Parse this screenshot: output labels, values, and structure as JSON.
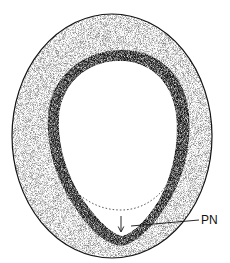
{
  "diagram": {
    "labels": {
      "pn": "PN"
    },
    "colors": {
      "stipple": "#2a2a2a",
      "outline": "#111111",
      "background": "#ffffff"
    }
  }
}
